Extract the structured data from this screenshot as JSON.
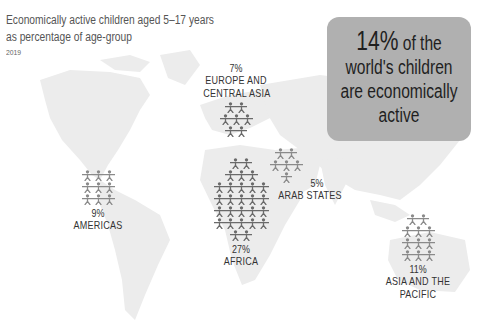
{
  "chart_data": {
    "type": "pictogram-map",
    "title": "Economically active children aged 5–17 years as percentage of age-group",
    "subtitle": "2019",
    "highlight": {
      "value": "14%",
      "text": "of the world's children are economically active"
    },
    "categories": [
      "Europe and Central Asia",
      "Americas",
      "Africa",
      "Arab States",
      "Asia and the Pacific"
    ],
    "values": [
      7,
      9,
      27,
      5,
      11
    ],
    "unit": "%",
    "colors": {
      "map": "#ececec",
      "icons": "#6e6e6e",
      "callout": "#b0b0b0"
    }
  },
  "header": {
    "title_line1": "Economically active children aged 5–17 years",
    "title_line2": "as percentage of age-group",
    "year": "2019"
  },
  "callout": {
    "pct": "14%",
    "line1_rest": " of the",
    "line2": "world's children",
    "line3": "are economically",
    "line4": "active"
  },
  "regions": [
    {
      "name": "EUROPE AND",
      "name2": "CENTRAL ASIA",
      "pct": "7%"
    },
    {
      "name": "AMERICAS",
      "pct": "9%"
    },
    {
      "name": "AFRICA",
      "pct": "27%"
    },
    {
      "name": "ARAB STATES",
      "pct": "5%"
    },
    {
      "name": "ASIA AND THE",
      "name2": "PACIFIC",
      "pct": "11%"
    }
  ]
}
